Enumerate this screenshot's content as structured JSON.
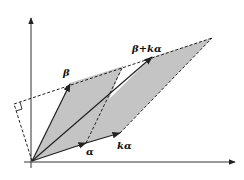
{
  "diagram": {
    "labels": {
      "beta": "β",
      "beta_plus_k_alpha": "β+kα",
      "alpha": "α",
      "k_alpha": "kα"
    },
    "colors": {
      "shade": "#c4c4c4",
      "line": "#222222",
      "background": "#ffffff"
    }
  }
}
